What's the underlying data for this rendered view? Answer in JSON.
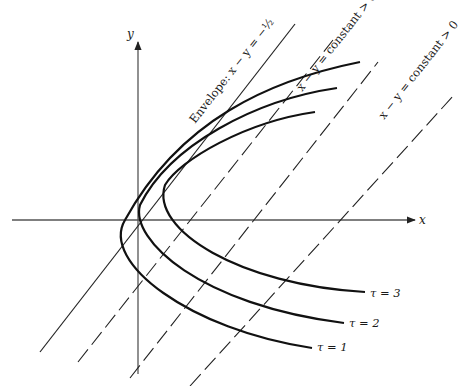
{
  "figure": {
    "type": "mathematical-diagram"
  },
  "axes": {
    "x_label": "x",
    "y_label": "y",
    "x_axis": {
      "x1": 12,
      "y": 220,
      "x2": 415
    },
    "y_axis": {
      "x": 138,
      "y1": 374,
      "y2": 42
    }
  },
  "envelope": {
    "label": "Envelope: x − y = −½",
    "line": {
      "x1": 40,
      "y1": 352,
      "x2": 295,
      "y2": 24
    }
  },
  "level_lines": [
    {
      "label": "x − y = constant > 0",
      "x1": 78,
      "y1": 362,
      "x2": 333,
      "y2": 40,
      "dashed": true,
      "labelled": true
    },
    {
      "label": "x − y = constant > 0",
      "x1": 130,
      "y1": 378,
      "x2": 378,
      "y2": 62,
      "dashed": true,
      "labelled": true
    },
    {
      "label": "",
      "x1": 190,
      "y1": 386,
      "x2": 454,
      "y2": 95,
      "dashed": true,
      "labelled": false
    }
  ],
  "curves": [
    {
      "name": "tau-1",
      "label": "τ = 1",
      "path": "M 360 62 C 270 80, 180 120, 125 220 C 100 262, 190 330, 312 348",
      "label_pos": {
        "x": 317,
        "y": 351
      }
    },
    {
      "name": "tau-2",
      "label": "τ = 2",
      "path": "M 337 88 C 255 100, 170 145, 140 205 C 130 240, 200 305, 344 323",
      "label_pos": {
        "x": 349,
        "y": 327
      }
    },
    {
      "name": "tau-3",
      "label": "τ = 3",
      "path": "M 315 112 C 245 122, 180 160, 165 185 C 150 230, 240 285, 365 292",
      "label_pos": {
        "x": 370,
        "y": 297
      }
    }
  ],
  "style": {
    "axis_color": "#555555",
    "curve_color": "#111111",
    "line_color": "#222222"
  }
}
